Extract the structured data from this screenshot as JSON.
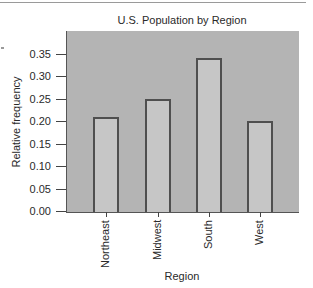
{
  "chart_data": {
    "type": "bar",
    "title": "U.S. Population by Region",
    "xlabel": "Region",
    "ylabel": "Relative frequency",
    "categories": [
      "Northeast",
      "Midwest",
      "South",
      "West"
    ],
    "values": [
      0.21,
      0.25,
      0.34,
      0.2
    ],
    "ylim": [
      0.0,
      0.39
    ],
    "yticks": [
      "0.00",
      "0.05",
      "0.10",
      "0.15",
      "0.20",
      "0.25",
      "0.30",
      "0.35"
    ],
    "grid": false,
    "legend": null,
    "colors": {
      "plot_background": "#b4b4b4",
      "bar_fill": "#c6c6c6",
      "bar_edge": "#4f4f4f"
    }
  }
}
